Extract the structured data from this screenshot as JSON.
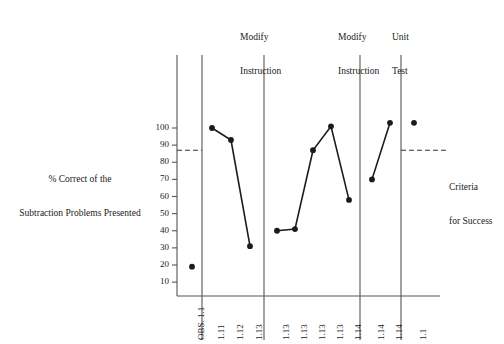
{
  "figure": {
    "y_axis_title_line1": "% Correct of the",
    "y_axis_title_line2": "Subtraction Problems Presented",
    "criteria_line1": "Criteria",
    "criteria_line2": "for Success",
    "phase_labels": [
      {
        "line1": "Modify",
        "line2": "Instruction"
      },
      {
        "line1": "Modify",
        "line2": "Instruction"
      },
      {
        "line1": "Unit",
        "line2": "Test"
      }
    ]
  },
  "chart_data": {
    "type": "line",
    "title": "",
    "xlabel": "",
    "ylabel": "% Correct of the Subtraction Problems Presented",
    "ylim": [
      0,
      110
    ],
    "yticks": [
      10,
      20,
      30,
      40,
      50,
      60,
      70,
      80,
      90,
      100
    ],
    "ytick_labels": [
      "10",
      "20",
      "30",
      "40",
      "50",
      "60",
      "70",
      "80",
      "90",
      "100"
    ],
    "grid": false,
    "legend": null,
    "x_tick_labels": [
      "OBS. 1.1",
      "1.11",
      "1.12",
      "1.13",
      "1.13",
      "1.13",
      "1.13",
      "1.13",
      "1.14",
      "1.14",
      "1.14",
      "1.1"
    ],
    "criteria_line_value": 87,
    "phases": [
      {
        "name": "Baseline",
        "header_line1": "",
        "header_line2": "",
        "points": [
          {
            "x_label": "OBS. 1.1",
            "value": 19
          }
        ]
      },
      {
        "name": "Instruction 1",
        "header_line1": "Modify",
        "header_line2": "Instruction",
        "points": [
          {
            "x_label": "1.11",
            "value": 100
          },
          {
            "x_label": "1.12",
            "value": 93
          },
          {
            "x_label": "1.13",
            "value": 31
          }
        ]
      },
      {
        "name": "Instruction 2",
        "header_line1": "Modify",
        "header_line2": "Instruction",
        "points": [
          {
            "x_label": "1.13",
            "value": 40
          },
          {
            "x_label": "1.13",
            "value": 41
          },
          {
            "x_label": "1.13",
            "value": 87
          },
          {
            "x_label": "1.13",
            "value": 101
          },
          {
            "x_label": "1.14",
            "value": 58
          }
        ]
      },
      {
        "name": "Instruction 3",
        "header_line1": "Unit",
        "header_line2": "Test",
        "points": [
          {
            "x_label": "1.14",
            "value": 70
          },
          {
            "x_label": "1.14",
            "value": 103
          }
        ]
      },
      {
        "name": "Unit Test",
        "header_line1": "",
        "header_line2": "",
        "points": [
          {
            "x_label": "1.1",
            "value": 103
          }
        ]
      }
    ],
    "colors": {
      "line": "#1b1b1b",
      "marker": "#1b1b1b",
      "axis": "#555555",
      "criteria_line": "#333333"
    }
  }
}
